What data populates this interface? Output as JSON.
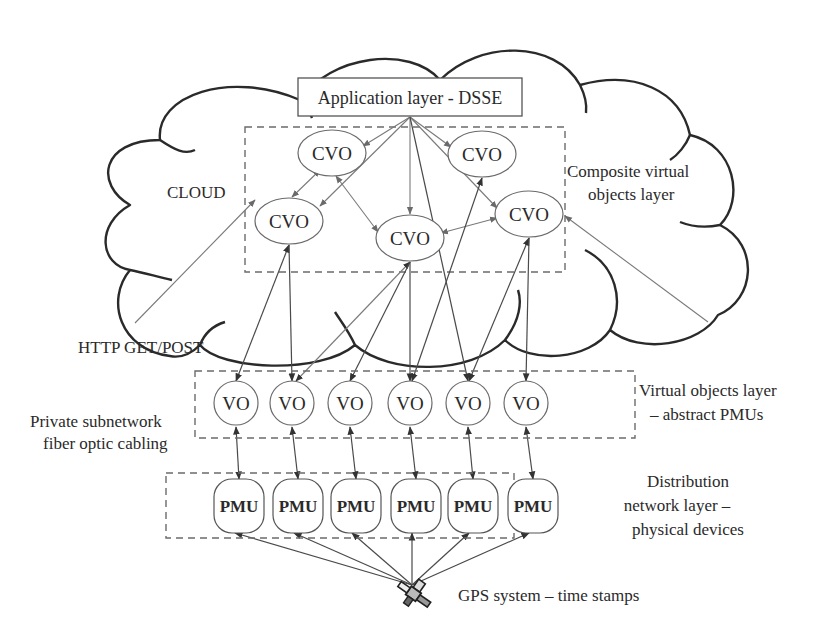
{
  "diagram": {
    "cloud_label": "CLOUD",
    "application_layer": {
      "label": "Application layer - DSSE"
    },
    "cvo_layer": {
      "label_line1": "Composite virtual",
      "label_line2": "objects layer",
      "nodes": [
        {
          "id": "cvo1",
          "label": "CVO"
        },
        {
          "id": "cvo2",
          "label": "CVO"
        },
        {
          "id": "cvo3",
          "label": "CVO"
        },
        {
          "id": "cvo4",
          "label": "CVO"
        },
        {
          "id": "cvo5",
          "label": "CVO"
        }
      ]
    },
    "vo_layer": {
      "label_line1": "Virtual objects layer",
      "label_line2": "– abstract PMUs",
      "nodes": [
        {
          "id": "vo1",
          "label": "VO"
        },
        {
          "id": "vo2",
          "label": "VO"
        },
        {
          "id": "vo3",
          "label": "VO"
        },
        {
          "id": "vo4",
          "label": "VO"
        },
        {
          "id": "vo5",
          "label": "VO"
        },
        {
          "id": "vo6",
          "label": "VO"
        }
      ]
    },
    "pmu_layer": {
      "label_line1": "Distribution",
      "label_line2": "network layer –",
      "label_line3": "physical devices",
      "nodes": [
        {
          "id": "pmu1",
          "label": "PMU"
        },
        {
          "id": "pmu2",
          "label": "PMU"
        },
        {
          "id": "pmu3",
          "label": "PMU"
        },
        {
          "id": "pmu4",
          "label": "PMU"
        },
        {
          "id": "pmu5",
          "label": "PMU"
        },
        {
          "id": "pmu6",
          "label": "PMU"
        }
      ]
    },
    "http_label": "HTTP GET/POST",
    "private_network_label_line1": "Private subnetwork",
    "private_network_label_line2": "fiber optic cabling",
    "gps_label": "GPS system – time stamps",
    "gps_icon": "satellite-icon",
    "edges": {
      "app_to_cvo": [
        "cvo1",
        "cvo2",
        "cvo3",
        "cvo4",
        "cvo5"
      ],
      "cvo_to_cvo": [
        [
          "cvo1",
          "cvo2"
        ],
        [
          "cvo1",
          "cvo4"
        ],
        [
          "cvo4",
          "cvo5"
        ]
      ],
      "cvo_to_vo": [
        [
          "cvo2",
          "vo1"
        ],
        [
          "cvo2",
          "vo2"
        ],
        [
          "cvo4",
          "vo2"
        ],
        [
          "cvo4",
          "vo3"
        ],
        [
          "cvo4",
          "vo4"
        ],
        [
          "cvo3",
          "vo4"
        ],
        [
          "cvo5",
          "vo5"
        ],
        [
          "cvo5",
          "vo6"
        ],
        [
          "app",
          "vo5"
        ]
      ],
      "vo_to_pmu": [
        [
          "vo1",
          "pmu1"
        ],
        [
          "vo2",
          "pmu2"
        ],
        [
          "vo3",
          "pmu3"
        ],
        [
          "vo4",
          "pmu4"
        ],
        [
          "vo5",
          "pmu5"
        ],
        [
          "vo6",
          "pmu6"
        ]
      ],
      "gps_to_pmu": [
        "pmu1",
        "pmu2",
        "pmu3",
        "pmu4",
        "pmu5",
        "pmu6"
      ],
      "http_external": [
        "cvo2",
        "cvo5"
      ]
    }
  }
}
